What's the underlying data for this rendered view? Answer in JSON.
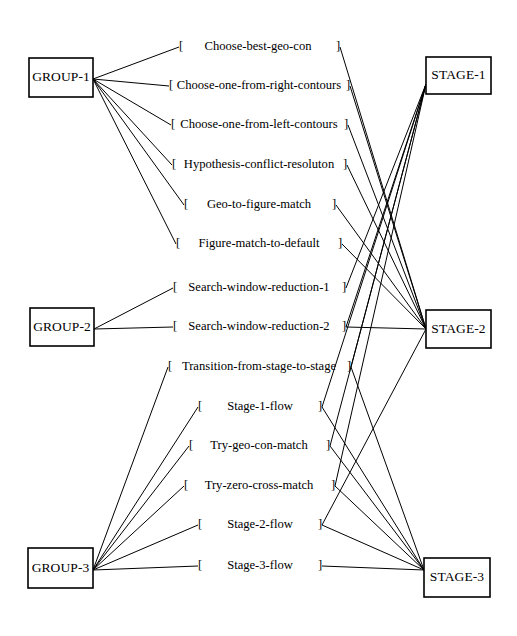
{
  "diagram": {
    "type": "bipartite-link-diagram",
    "colors": {
      "line": "#000000",
      "box_fill": "#ffffff",
      "box_stroke": "#000000",
      "text": "#000000"
    },
    "groups": [
      {
        "id": "GROUP-1",
        "label": "GROUP-1",
        "x": 29,
        "y": 58,
        "w": 64,
        "h": 39,
        "anchor_x": 93,
        "anchor_y": 79
      },
      {
        "id": "GROUP-2",
        "label": "GROUP-2",
        "x": 30,
        "y": 308,
        "w": 64,
        "h": 38,
        "anchor_x": 94,
        "anchor_y": 329
      },
      {
        "id": "GROUP-3",
        "label": "GROUP-3",
        "x": 28,
        "y": 548,
        "w": 65,
        "h": 40,
        "anchor_x": 93,
        "anchor_y": 570
      }
    ],
    "stages": [
      {
        "id": "STAGE-1",
        "label": "STAGE-1",
        "x": 426,
        "y": 57,
        "w": 65,
        "h": 37,
        "anchor_x": 426,
        "anchor_y": 84
      },
      {
        "id": "STAGE-2",
        "label": "STAGE-2",
        "x": 426,
        "y": 310,
        "w": 65,
        "h": 38,
        "anchor_x": 426,
        "anchor_y": 329
      },
      {
        "id": "STAGE-3",
        "label": "STAGE-3",
        "x": 424,
        "y": 558,
        "w": 66,
        "h": 39,
        "anchor_x": 424,
        "anchor_y": 570
      }
    ],
    "tasks": [
      {
        "id": "t1",
        "open": "[",
        "text": "Choose-best-geo-con",
        "close": "]",
        "y": 47,
        "left_x": 181,
        "right_x": 338,
        "center_x": 258,
        "spaced": true
      },
      {
        "id": "t2",
        "open": "[",
        "text": "Choose-one-from-right-contours",
        "close": "]",
        "y": 86,
        "left_x": 171,
        "right_x": 348,
        "center_x": 259,
        "spaced": false
      },
      {
        "id": "t3",
        "open": "[",
        "text": "Choose-one-from-left-contours",
        "close": "]",
        "y": 125,
        "left_x": 173,
        "right_x": 346,
        "center_x": 259,
        "spaced": false
      },
      {
        "id": "t4",
        "open": "[",
        "text": "Hypothesis-conflict-resoluton",
        "close": "]",
        "y": 165,
        "left_x": 174,
        "right_x": 345,
        "center_x": 259,
        "spaced": false
      },
      {
        "id": "t5",
        "open": "[",
        "text": "Geo-to-figure-match",
        "close": "]",
        "y": 205,
        "left_x": 186,
        "right_x": 334,
        "center_x": 259,
        "spaced": true
      },
      {
        "id": "t6",
        "open": "[",
        "text": "Figure-match-to-default",
        "close": "]",
        "y": 244,
        "left_x": 178,
        "right_x": 340,
        "center_x": 259,
        "spaced": true
      },
      {
        "id": "t7",
        "open": "[",
        "text": "Search-window-reduction-1",
        "close": "]",
        "y": 288,
        "left_x": 175,
        "right_x": 344,
        "center_x": 259,
        "spaced": true
      },
      {
        "id": "t8",
        "open": "[",
        "text": "Search-window-reduction-2",
        "close": "]",
        "y": 327,
        "left_x": 175,
        "right_x": 344,
        "center_x": 259,
        "spaced": true
      },
      {
        "id": "t9",
        "open": "[",
        "text": "Transition-from-stage-to-stage",
        "close": "]",
        "y": 367,
        "left_x": 170,
        "right_x": 349,
        "center_x": 259,
        "spaced": false
      },
      {
        "id": "t10",
        "open": "[",
        "text": "Stage-1-flow",
        "close": "]",
        "y": 407,
        "left_x": 200,
        "right_x": 320,
        "center_x": 260,
        "spaced": true
      },
      {
        "id": "t11",
        "open": "[",
        "text": "Try-geo-con-match",
        "close": "]",
        "y": 446,
        "left_x": 191,
        "right_x": 328,
        "center_x": 259,
        "spaced": true
      },
      {
        "id": "t12",
        "open": "[",
        "text": "Try-zero-cross-match",
        "close": "]",
        "y": 486,
        "left_x": 186,
        "right_x": 333,
        "center_x": 259,
        "spaced": true
      },
      {
        "id": "t13",
        "open": "[",
        "text": "Stage-2-flow",
        "close": "]",
        "y": 525,
        "left_x": 200,
        "right_x": 320,
        "center_x": 260,
        "spaced": true
      },
      {
        "id": "t14",
        "open": "[",
        "text": "Stage-3-flow",
        "close": "]",
        "y": 566,
        "left_x": 200,
        "right_x": 320,
        "center_x": 260,
        "spaced": true
      }
    ],
    "group_edges": [
      {
        "from": "GROUP-1",
        "to": "t1"
      },
      {
        "from": "GROUP-1",
        "to": "t2"
      },
      {
        "from": "GROUP-1",
        "to": "t3"
      },
      {
        "from": "GROUP-1",
        "to": "t4"
      },
      {
        "from": "GROUP-1",
        "to": "t5"
      },
      {
        "from": "GROUP-1",
        "to": "t6"
      },
      {
        "from": "GROUP-2",
        "to": "t7"
      },
      {
        "from": "GROUP-2",
        "to": "t8"
      },
      {
        "from": "GROUP-3",
        "to": "t9"
      },
      {
        "from": "GROUP-3",
        "to": "t10"
      },
      {
        "from": "GROUP-3",
        "to": "t11"
      },
      {
        "from": "GROUP-3",
        "to": "t12"
      },
      {
        "from": "GROUP-3",
        "to": "t13"
      },
      {
        "from": "GROUP-3",
        "to": "t14"
      }
    ],
    "stage_edges": [
      {
        "from": "t1",
        "to": "STAGE-2"
      },
      {
        "from": "t2",
        "to": "STAGE-2"
      },
      {
        "from": "t3",
        "to": "STAGE-2"
      },
      {
        "from": "t4",
        "to": "STAGE-2"
      },
      {
        "from": "t5",
        "to": "STAGE-2"
      },
      {
        "from": "t6",
        "to": "STAGE-2"
      },
      {
        "from": "t7",
        "to": "STAGE-1"
      },
      {
        "from": "t8",
        "to": "STAGE-1"
      },
      {
        "from": "t8",
        "to": "STAGE-2"
      },
      {
        "from": "t9",
        "to": "STAGE-1"
      },
      {
        "from": "t10",
        "to": "STAGE-1"
      },
      {
        "from": "t11",
        "to": "STAGE-1"
      },
      {
        "from": "t12",
        "to": "STAGE-1"
      },
      {
        "from": "t13",
        "to": "STAGE-2"
      },
      {
        "from": "t9",
        "to": "STAGE-3"
      },
      {
        "from": "t10",
        "to": "STAGE-3"
      },
      {
        "from": "t11",
        "to": "STAGE-3"
      },
      {
        "from": "t12",
        "to": "STAGE-3"
      },
      {
        "from": "t13",
        "to": "STAGE-3"
      },
      {
        "from": "t14",
        "to": "STAGE-3"
      }
    ]
  }
}
